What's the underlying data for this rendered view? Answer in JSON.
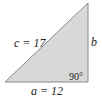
{
  "diagram": {
    "type": "right-triangle",
    "colors": {
      "fill": "#d8d8d8",
      "stroke": "#8a8a8a",
      "text": "#222222"
    },
    "vertices": {
      "bottom_left": [
        5,
        82
      ],
      "right_angle": [
        88,
        82
      ],
      "top": [
        88,
        3
      ]
    },
    "labels": {
      "hypotenuse": "c = 17",
      "vertical_leg": "b",
      "horizontal_leg": "a = 12",
      "right_angle": "90°"
    }
  }
}
